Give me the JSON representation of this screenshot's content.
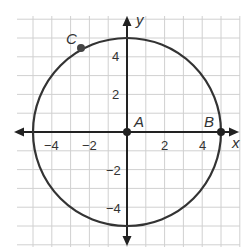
{
  "diagram": {
    "type": "coordinate-plane-circle",
    "axes": {
      "x_label": "x",
      "y_label": "y",
      "x_ticks": [
        {
          "value": -4,
          "label": "−4"
        },
        {
          "value": -2,
          "label": "−2"
        },
        {
          "value": 2,
          "label": "2"
        },
        {
          "value": 4,
          "label": "4"
        }
      ],
      "y_ticks": [
        {
          "value": 4,
          "label": "4"
        },
        {
          "value": 2,
          "label": "2"
        },
        {
          "value": -2,
          "label": "−2"
        },
        {
          "value": -4,
          "label": "−4"
        }
      ]
    },
    "grid": {
      "xmin": -6,
      "xmax": 6,
      "ymin": -6,
      "ymax": 6,
      "step": 1
    },
    "circle": {
      "center": [
        0,
        0
      ],
      "radius": 5
    },
    "points": [
      {
        "name": "A",
        "x": 0,
        "y": 0
      },
      {
        "name": "B",
        "x": 5,
        "y": 0
      },
      {
        "name": "C",
        "x": -2.5,
        "y": 4.33
      }
    ],
    "colors": {
      "grid": "#d0d0d0",
      "axis": "#222222",
      "circle": "#333333",
      "text": "#333333"
    }
  }
}
